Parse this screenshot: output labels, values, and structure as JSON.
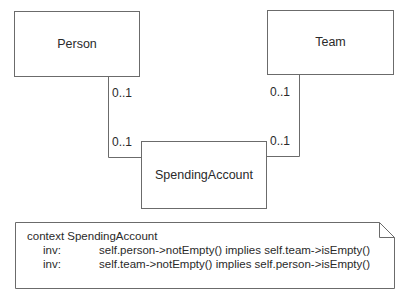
{
  "diagram": {
    "type": "UML class diagram with OCL constraint note",
    "classes": [
      {
        "id": "person",
        "name": "Person"
      },
      {
        "id": "team",
        "name": "Team"
      },
      {
        "id": "spending_account",
        "name": "SpendingAccount"
      }
    ],
    "associations": [
      {
        "from": "Person",
        "to": "SpendingAccount",
        "multiplicity_near_from": "0..1",
        "multiplicity_near_to": "0..1"
      },
      {
        "from": "Team",
        "to": "SpendingAccount",
        "multiplicity_near_from": "0..1",
        "multiplicity_near_to": "0..1"
      }
    ],
    "note": {
      "context": "context SpendingAccount",
      "invariants": [
        {
          "keyword": "inv:",
          "expression": "self.person->notEmpty() implies self.team->isEmpty()"
        },
        {
          "keyword": "inv:",
          "expression": "self.team->notEmpty() implies self.person->isEmpty()"
        }
      ]
    },
    "colors": {
      "stroke": "#6b6b6b",
      "text": "#2a2a2a",
      "background": "#ffffff"
    }
  }
}
